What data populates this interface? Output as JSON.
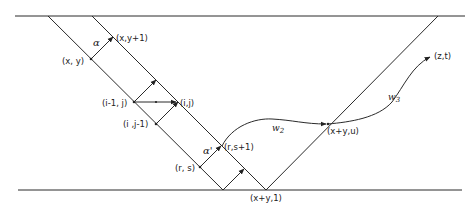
{
  "diagram": {
    "labels": {
      "xy": "(x, y)",
      "xy1": "(x,y+1)",
      "alpha": "α",
      "im1j": "(i-1, j)",
      "ij": "(i,j)",
      "ijm1": "(i ,j-1)",
      "rs": "(r, s)",
      "rs1": "(r,s+1)",
      "alpha_prime": "α'",
      "xpy1": "(x+y,1)",
      "xpyu": "(x+y,u)",
      "w2": "w",
      "w2_sub": "2",
      "w3": "w",
      "w3_sub": "3",
      "zt": "(z,t)"
    },
    "colors": {
      "line": "#2a2a2a",
      "background": "#ffffff"
    }
  }
}
